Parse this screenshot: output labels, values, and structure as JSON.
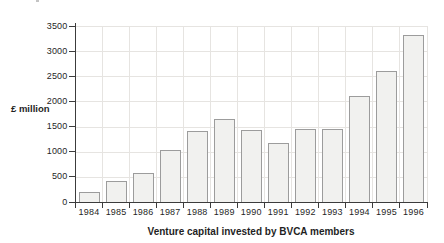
{
  "chart_data": {
    "type": "bar",
    "title": "Venture capital invested by BVCA members",
    "ylabel": "£ million",
    "categories": [
      "1984",
      "1985",
      "1986",
      "1987",
      "1988",
      "1989",
      "1990",
      "1991",
      "1992",
      "1993",
      "1994",
      "1995",
      "1996"
    ],
    "values": [
      190,
      420,
      580,
      1030,
      1410,
      1650,
      1440,
      1170,
      1460,
      1460,
      2100,
      2600,
      3330
    ],
    "ylim": [
      0,
      3500
    ],
    "ytick_step": 500,
    "grid": true,
    "legend": "none"
  },
  "colors": {
    "background": "#ffffff",
    "bar_fill": "#f1f1ef",
    "bar_border": "#9c9c9c",
    "grid": "#e6e4e1",
    "axis": "#3c3c3c",
    "text": "#1f1f1f"
  }
}
